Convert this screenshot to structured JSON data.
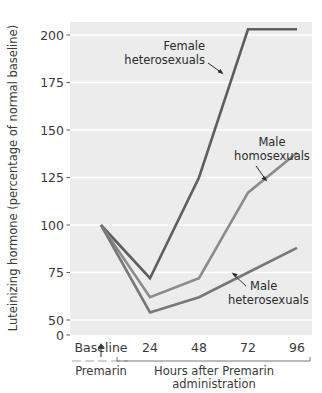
{
  "chart_data": {
    "type": "line",
    "title": "",
    "xlabel": "Hours after Premarin administration",
    "ylabel": "Luteinizing hormone (percentage of normal baseline)",
    "x": [
      0,
      24,
      48,
      72,
      96
    ],
    "categories": [
      "Baseline",
      "24",
      "48",
      "72",
      "96"
    ],
    "xtick_labels": [
      "Baseline",
      "24",
      "48",
      "72",
      "96"
    ],
    "ytick_labels": [
      "0",
      "50",
      "75",
      "100",
      "125",
      "150",
      "175",
      "200"
    ],
    "ytick_values": [
      0,
      50,
      75,
      100,
      125,
      150,
      175,
      200
    ],
    "ylim": [
      0,
      212
    ],
    "xlim": [
      0,
      96
    ],
    "grid": "horizontal",
    "legend": "none",
    "plot_background": "#ececed",
    "gridline_color": "#ffffff",
    "series": [
      {
        "name": "Female heterosexuals",
        "color": "#5e5e5e",
        "values": [
          100,
          72,
          125,
          203,
          203
        ]
      },
      {
        "name": "Male homosexuals",
        "color": "#8b8b8b",
        "values": [
          100,
          62,
          72,
          117,
          138
        ]
      },
      {
        "name": "Male heterosexuals",
        "color": "#777777",
        "values": [
          100,
          54,
          62,
          75,
          88
        ]
      }
    ],
    "annotations": [
      {
        "text_line1": "Female",
        "text_line2": "heterosexuals",
        "target_series": "Female heterosexuals"
      },
      {
        "text_line1": "Male",
        "text_line2": "homosexuals",
        "target_series": "Male homosexuals"
      },
      {
        "text_line1": "Male",
        "text_line2": "heterosexuals",
        "target_series": "Male heterosexuals"
      }
    ],
    "baseline_marker_label": "Premarin",
    "baseline_marker_symbol": "arrow-up"
  },
  "axis": {
    "y_title": "Luteinizing hormone (percentage of normal baseline)",
    "x_title_line1": "Hours after Premarin",
    "x_title_line2": "administration",
    "premarin_label": "Premarin"
  },
  "ticks": {
    "y": [
      "200",
      "175",
      "150",
      "125",
      "100",
      "75",
      "50",
      "0"
    ],
    "x": [
      "Baseline",
      "24",
      "48",
      "72",
      "96"
    ]
  },
  "annotations": {
    "female_hetero_l1": "Female",
    "female_hetero_l2": "heterosexuals",
    "male_homo_l1": "Male",
    "male_homo_l2": "homosexuals",
    "male_hetero_l1": "Male",
    "male_hetero_l2": "heterosexuals"
  }
}
